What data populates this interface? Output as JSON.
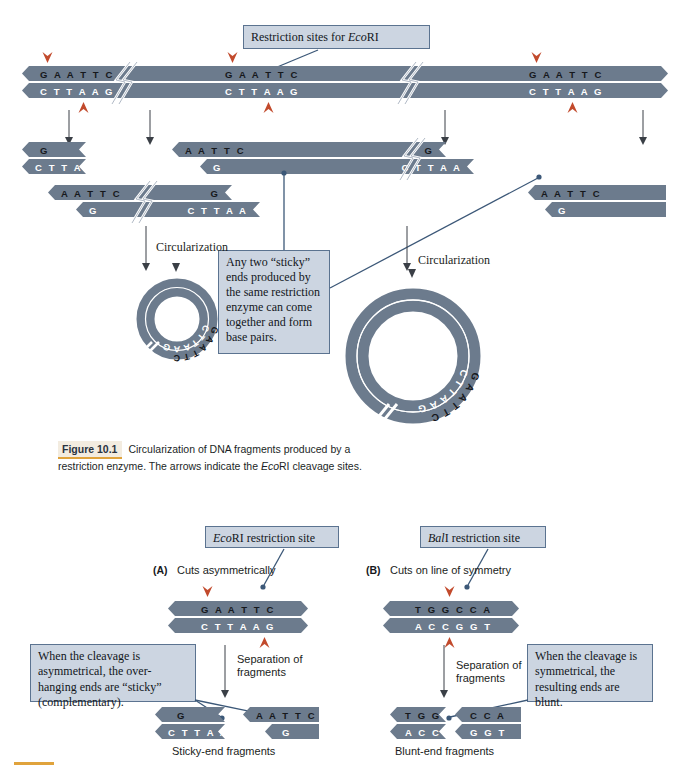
{
  "figure": {
    "number": "Figure 10.1",
    "caption_line1": "Circularization of DNA fragments produced by a",
    "caption_line2_a": "restriction enzyme. The arrows indicate the ",
    "caption_line2_italic": "Eco",
    "caption_line2_b": "RI cleavage sites."
  },
  "top_panel": {
    "callout_restriction_sites": {
      "text_before": "Restriction sites for ",
      "text_italic": "Eco",
      "text_after": "RI"
    },
    "full_duplex": {
      "top_sequences": [
        "G A A T T C",
        "G A A T T C",
        "G A A T T C"
      ],
      "bottom_sequences": [
        "C T T A A G",
        "C T T A A G",
        "C T T A A G"
      ]
    },
    "fragments_row1": [
      {
        "top": "G",
        "bottom": "C T T A A"
      },
      {
        "top": "A A T T C",
        "bottom": "G",
        "right_top": "G",
        "right_bottom": "C T T A A"
      }
    ],
    "fragments_row2": [
      {
        "top": "A A T T C",
        "bottom": "G",
        "right_top": "G",
        "right_bottom": "C T T A A"
      },
      {
        "top": "A A T T C",
        "bottom": "G"
      }
    ],
    "callout_sticky": "Any two “sticky” ends produced by the same restriction enzyme can come together and form base pairs.",
    "circularization_label_left": "Circularization",
    "circularization_label_right": "Circularization",
    "plasmid_small": {
      "outer_seq": "GAATTC",
      "inner_seq": "CTTAAG"
    },
    "plasmid_large": {
      "outer_seq": "GAATTC",
      "inner_seq": "CTTAAG"
    }
  },
  "bottom_panel": {
    "panel_a": {
      "tag": "(A)",
      "heading": "Cuts asymmetrically",
      "callout_site": {
        "italic": "Eco",
        "rest": "RI restriction site"
      },
      "duplex": {
        "top": "G A A T T C",
        "bottom": "C T T A A G"
      },
      "separation_label_line1": "Separation of",
      "separation_label_line2": "fragments",
      "callout_cleavage": "When the cleavage is asymmetrical, the over-hanging ends are “sticky” (complementary).",
      "fragment_left": {
        "top": "G",
        "bottom": "C T T A A"
      },
      "fragment_right": {
        "top": "A A T T C",
        "bottom": "G"
      },
      "fragment_caption": "Sticky-end fragments"
    },
    "panel_b": {
      "tag": "(B)",
      "heading": "Cuts on line of symmetry",
      "callout_site": {
        "italic": "Bal",
        "rest": "I restriction site"
      },
      "duplex": {
        "top": "T G G C C A",
        "bottom": "A C C G G T"
      },
      "separation_label_line1": "Separation of",
      "separation_label_line2": "fragments",
      "callout_cleavage": "When the cleavage is symmetrical, the resulting ends are blunt.",
      "fragment_left": {
        "top": "T G G",
        "bottom": "A C C"
      },
      "fragment_right": {
        "top": "C C A",
        "bottom": "G G T"
      },
      "fragment_caption": "Blunt-end fragments"
    }
  },
  "colors": {
    "dna_strand": "#6c7b8d",
    "cleavage_arrow": "#c24a2c",
    "callout_fill": "#ccd5e1",
    "callout_border": "#5b7390",
    "leader_line": "#3c5878",
    "figure_accent": "#e0a33c"
  }
}
